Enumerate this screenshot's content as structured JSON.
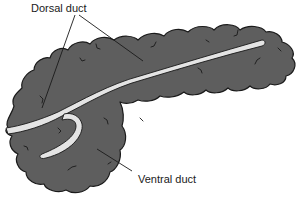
{
  "figure": {
    "colors": {
      "organ_fill": "#5e5e5e",
      "organ_outline": "#1a1a1a",
      "duct_fill": "#e4e4e4",
      "leader_line": "#1a1a1a",
      "background": "#ffffff"
    }
  },
  "labels": {
    "dorsal_duct": "Dorsal duct",
    "ventral_duct": "Ventral duct"
  }
}
